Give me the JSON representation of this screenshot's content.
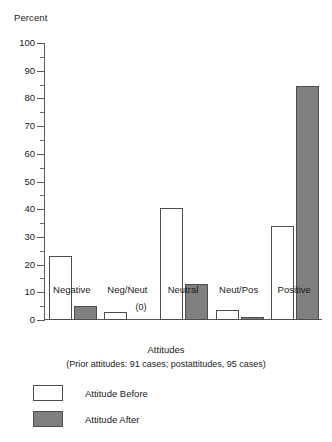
{
  "chart_data": {
    "type": "bar",
    "title": "",
    "ylabel": "Percent",
    "xlabel": "Attitudes",
    "note": "(Prior attitudes: 91 cases; postattitudes, 95 cases)",
    "categories": [
      "Negative",
      "Neg/Neut",
      "Neutral",
      "Neut/Pos",
      "Positive"
    ],
    "series": [
      {
        "name": "Attitude Before",
        "color": "#ffffff",
        "values": [
          23,
          3,
          40.5,
          3.5,
          34
        ]
      },
      {
        "name": "Attitude After",
        "color": "#808080",
        "values": [
          5,
          0,
          13,
          1,
          84.5
        ]
      }
    ],
    "point_annotations": [
      {
        "category": "Neg/Neut",
        "series": "Attitude After",
        "text": "(0)"
      }
    ],
    "ylim": [
      0,
      100
    ],
    "ytick_labels": [
      "0",
      "10",
      "20",
      "30",
      "40",
      "50",
      "60",
      "70",
      "80",
      "90",
      "100"
    ],
    "ytick_values": [
      0,
      10,
      20,
      30,
      40,
      50,
      60,
      70,
      80,
      90,
      100
    ],
    "yminor_values": [
      5,
      15,
      25,
      35,
      45,
      55,
      65,
      75,
      85,
      95
    ],
    "grid": false,
    "legend_position": "below-left"
  },
  "legend": {
    "items": [
      {
        "label": "Attitude Before",
        "swatch": "before"
      },
      {
        "label": "Attitude After",
        "swatch": "after"
      }
    ]
  }
}
